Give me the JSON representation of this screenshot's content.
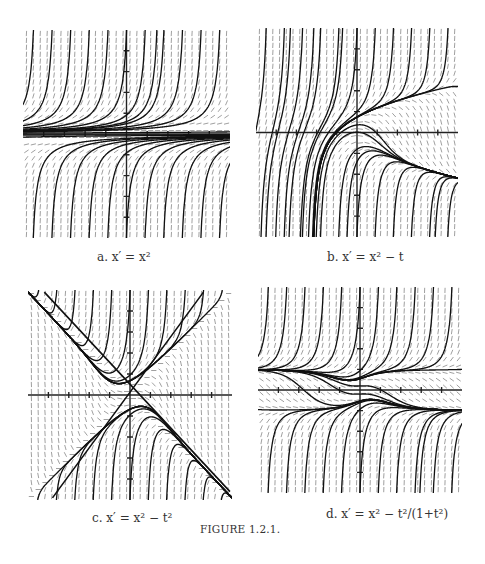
{
  "figure": {
    "title": "FIGURE 1.2.1.",
    "panels": [
      {
        "id": "a",
        "label": "a.",
        "equation": "x′ = x²",
        "caption": "a. x′ = x²",
        "rhs": "x^2",
        "box": [
          23,
          30,
          207,
          208
        ],
        "range": {
          "t": [
            -5,
            5
          ],
          "x": [
            -5,
            5
          ]
        }
      },
      {
        "id": "b",
        "label": "b.",
        "equation": "x′ = x² − t",
        "caption": "b. x′ = x² − t",
        "rhs": "x^2 - t",
        "box": [
          256,
          28,
          202,
          209
        ],
        "range": {
          "t": [
            -5,
            5
          ],
          "x": [
            -5,
            5
          ]
        }
      },
      {
        "id": "c",
        "label": "c.",
        "equation": "x′ = x² − t²",
        "caption": "c. x′ = x² − t²",
        "rhs": "x^2 - t^2",
        "box": [
          28,
          290,
          204,
          210
        ],
        "range": {
          "t": [
            -5,
            5
          ],
          "x": [
            -5,
            5
          ]
        }
      },
      {
        "id": "d",
        "label": "d.",
        "equation": "x′ = x² − t²/(1+t²)",
        "caption": "d. x′ = x² − t²/(1+t²)",
        "rhs": "x^2 - t^2/(1+t^2)",
        "box": [
          258,
          287,
          204,
          206
        ],
        "range": {
          "t": [
            -5,
            5
          ],
          "x": [
            -5,
            5
          ]
        }
      }
    ]
  },
  "chart_data": [
    {
      "type": "slope-field",
      "title": "a. x′ = x²",
      "xlabel": "t",
      "ylabel": "x",
      "xlim": [
        -5,
        5
      ],
      "ylim": [
        -5,
        5
      ],
      "grid": false,
      "axes_ticks": [
        -4,
        -3,
        -2,
        -1,
        1,
        2,
        3,
        4
      ],
      "notes": "Solutions blow up; x=0 is a semi-stable equilibrium"
    },
    {
      "type": "slope-field",
      "title": "b. x′ = x² − t",
      "xlabel": "t",
      "ylabel": "x",
      "xlim": [
        -5,
        5
      ],
      "ylim": [
        -5,
        5
      ],
      "grid": false,
      "axes_ticks": [
        -4,
        -3,
        -2,
        -1,
        1,
        2,
        3,
        4
      ],
      "notes": "Funnel along x = −√t, antifunnel along x = √t"
    },
    {
      "type": "slope-field",
      "title": "c. x′ = x² − t²",
      "xlabel": "t",
      "ylabel": "x",
      "xlim": [
        -5,
        5
      ],
      "ylim": [
        -5,
        5
      ],
      "grid": false,
      "axes_ticks": [
        -4,
        -3,
        -2,
        -1,
        1,
        2,
        3,
        4
      ],
      "notes": "Isoclines x = ±t drawn as crossing lines"
    },
    {
      "type": "slope-field",
      "title": "d. x′ = x² − t²/(1+t²)",
      "xlabel": "t",
      "ylabel": "x",
      "xlim": [
        -5,
        5
      ],
      "ylim": [
        -5,
        5
      ],
      "grid": false,
      "axes_ticks": [
        -4,
        -3,
        -2,
        -1,
        1,
        2,
        3,
        4
      ],
      "notes": "Curves x = ±|t|/√(1+t²) bound a band near x = ±1"
    }
  ]
}
